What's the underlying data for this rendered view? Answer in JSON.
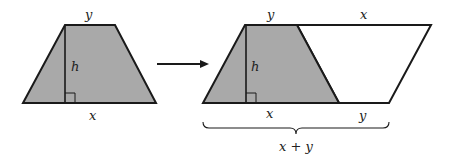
{
  "diagram": {
    "colors": {
      "shaded": "#a9a9a9",
      "stroke": "#1a1a1a",
      "background": "#ffffff"
    },
    "left_figure": {
      "top_label": "y",
      "height_label": "h",
      "bottom_label": "x"
    },
    "arrow": {
      "direction": "right"
    },
    "right_figure": {
      "top_left_label": "y",
      "top_right_label": "x",
      "height_label": "h",
      "bottom_left_label": "x",
      "bottom_right_label": "y",
      "brace_label": "x + y"
    }
  }
}
